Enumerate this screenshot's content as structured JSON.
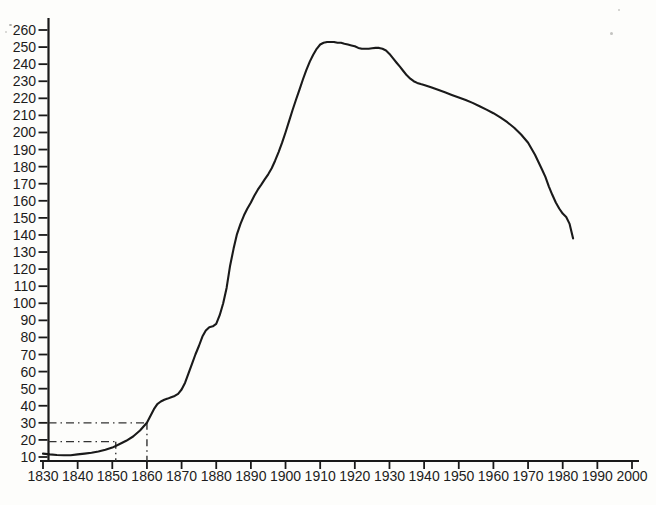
{
  "figure": {
    "background": "#fdfdfb",
    "ink_color": "#1a1a1a",
    "guide_color": "#333333"
  },
  "chart_data": {
    "type": "line",
    "title": "",
    "xlabel": "",
    "ylabel": "",
    "grid": false,
    "legend": "none",
    "x_axis": {
      "min": 1830,
      "max": 2000,
      "tick_step": 10,
      "tick_labels": [
        "1830",
        "1840",
        "1850",
        "1860",
        "1870",
        "1880",
        "1890",
        "1900",
        "1910",
        "1920",
        "1930",
        "1940",
        "1950",
        "1960",
        "1970",
        "1980",
        "1990",
        "2000"
      ]
    },
    "y_axis": {
      "min": 10,
      "max": 260,
      "tick_step": 10,
      "tick_labels": [
        "260",
        "250",
        "240",
        "230",
        "220",
        "210",
        "200",
        "190",
        "180",
        "170",
        "160",
        "150",
        "140",
        "130",
        "120",
        "110",
        "100",
        "90",
        "80",
        "70",
        "60",
        "50",
        "40",
        "30",
        "20",
        "10"
      ]
    },
    "series": [
      {
        "name": "main-curve",
        "points": [
          [
            1830,
            12
          ],
          [
            1832,
            11.5
          ],
          [
            1834,
            11.2
          ],
          [
            1836,
            11
          ],
          [
            1838,
            11
          ],
          [
            1840,
            11.5
          ],
          [
            1842,
            12
          ],
          [
            1844,
            12.5
          ],
          [
            1846,
            13.2
          ],
          [
            1848,
            14.2
          ],
          [
            1850,
            15.5
          ],
          [
            1852,
            17.5
          ],
          [
            1854,
            19.5
          ],
          [
            1856,
            22
          ],
          [
            1858,
            25.5
          ],
          [
            1860,
            30
          ],
          [
            1861,
            34
          ],
          [
            1862,
            38
          ],
          [
            1863,
            41
          ],
          [
            1864,
            42.5
          ],
          [
            1865,
            43.5
          ],
          [
            1866,
            44.2
          ],
          [
            1867,
            45
          ],
          [
            1868,
            45.8
          ],
          [
            1869,
            47
          ],
          [
            1870,
            49.5
          ],
          [
            1871,
            53.5
          ],
          [
            1872,
            59
          ],
          [
            1873,
            64.5
          ],
          [
            1874,
            70
          ],
          [
            1875,
            75
          ],
          [
            1876,
            80.5
          ],
          [
            1877,
            84
          ],
          [
            1878,
            86
          ],
          [
            1879,
            86.5
          ],
          [
            1880,
            88
          ],
          [
            1881,
            93
          ],
          [
            1882,
            100
          ],
          [
            1883,
            109
          ],
          [
            1884,
            122
          ],
          [
            1885,
            132
          ],
          [
            1886,
            140.5
          ],
          [
            1887,
            146.5
          ],
          [
            1888,
            151.5
          ],
          [
            1889,
            155.5
          ],
          [
            1890,
            159
          ],
          [
            1891,
            163
          ],
          [
            1892,
            166.5
          ],
          [
            1893,
            169.5
          ],
          [
            1894,
            172.5
          ],
          [
            1895,
            175.5
          ],
          [
            1896,
            179
          ],
          [
            1897,
            183.5
          ],
          [
            1898,
            188.5
          ],
          [
            1899,
            194
          ],
          [
            1900,
            200
          ],
          [
            1901,
            206.5
          ],
          [
            1902,
            213
          ],
          [
            1903,
            219
          ],
          [
            1904,
            225
          ],
          [
            1905,
            231
          ],
          [
            1906,
            236.5
          ],
          [
            1907,
            241.5
          ],
          [
            1908,
            245.5
          ],
          [
            1909,
            249
          ],
          [
            1910,
            251.5
          ],
          [
            1911,
            252.5
          ],
          [
            1912,
            253
          ],
          [
            1913,
            253
          ],
          [
            1914,
            253
          ],
          [
            1915,
            252.5
          ],
          [
            1916,
            252.5
          ],
          [
            1917,
            252
          ],
          [
            1918,
            251.5
          ],
          [
            1919,
            251
          ],
          [
            1920,
            250.5
          ],
          [
            1921,
            249.5
          ],
          [
            1922,
            249
          ],
          [
            1923,
            249
          ],
          [
            1924,
            249
          ],
          [
            1925,
            249.3
          ],
          [
            1926,
            249.5
          ],
          [
            1927,
            249.5
          ],
          [
            1928,
            249
          ],
          [
            1929,
            248
          ],
          [
            1930,
            246
          ],
          [
            1931,
            243.5
          ],
          [
            1932,
            241
          ],
          [
            1933,
            238.5
          ],
          [
            1934,
            236
          ],
          [
            1935,
            233.5
          ],
          [
            1936,
            231.5
          ],
          [
            1937,
            230
          ],
          [
            1938,
            229
          ],
          [
            1939,
            228.3
          ],
          [
            1940,
            227.8
          ],
          [
            1942,
            226.5
          ],
          [
            1944,
            225
          ],
          [
            1946,
            223.5
          ],
          [
            1948,
            222
          ],
          [
            1950,
            220.5
          ],
          [
            1952,
            219
          ],
          [
            1954,
            217.3
          ],
          [
            1956,
            215.4
          ],
          [
            1958,
            213.4
          ],
          [
            1960,
            211.3
          ],
          [
            1962,
            208.8
          ],
          [
            1964,
            206
          ],
          [
            1966,
            202.8
          ],
          [
            1968,
            198.8
          ],
          [
            1970,
            194
          ],
          [
            1972,
            187
          ],
          [
            1974,
            178.5
          ],
          [
            1975,
            174
          ],
          [
            1976,
            168.5
          ],
          [
            1977,
            163.5
          ],
          [
            1978,
            159
          ],
          [
            1979,
            155.5
          ],
          [
            1980,
            152.5
          ],
          [
            1981,
            150.5
          ],
          [
            1982,
            146.5
          ],
          [
            1983,
            138
          ]
        ]
      }
    ],
    "guide_lines": [
      {
        "name": "guide-30-1860",
        "value": 30,
        "year": 1860,
        "style": "dash-dot"
      },
      {
        "name": "guide-19-1851",
        "value": 19,
        "year": 1851,
        "style": "dash-dot"
      }
    ]
  }
}
